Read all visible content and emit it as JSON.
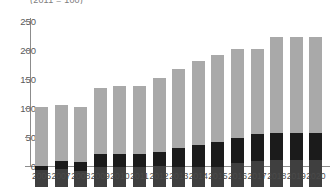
{
  "chart": {
    "subtitle_clipped": "(2011 = 100)",
    "axis": {
      "y_ticks": [
        "0",
        "50",
        "100",
        "150",
        "200",
        "250"
      ],
      "ylim": [
        0,
        270
      ]
    }
  },
  "chart_data": {
    "type": "bar",
    "stacked": true,
    "title": "",
    "subtitle": "(2011 = 100)",
    "xlabel": "",
    "ylabel": "",
    "ylim": [
      0,
      270
    ],
    "y_ticks": [
      0,
      50,
      100,
      150,
      200,
      250
    ],
    "grid": false,
    "legend": "none",
    "categories": [
      "2006",
      "2007",
      "2008",
      "2009",
      "2010",
      "2011",
      "2012",
      "2013",
      "2014",
      "2015",
      "2016",
      "2017",
      "2018",
      "2019",
      "2020"
    ],
    "series": [
      {
        "name": "bottom-segment",
        "color": "#3f3f3f",
        "values": [
          30,
          31,
          27,
          35,
          35,
          35,
          36,
          35,
          35,
          34,
          42,
          45,
          47,
          47,
          47
        ]
      },
      {
        "name": "middle-segment",
        "color": "#1b1b1b",
        "values": [
          7,
          14,
          16,
          22,
          22,
          22,
          25,
          33,
          38,
          44,
          43,
          47,
          47,
          47,
          47
        ]
      },
      {
        "name": "top-segment",
        "color": "#a9a9a9",
        "values": [
          101,
          96,
          95,
          113,
          117,
          117,
          127,
          135,
          145,
          150,
          153,
          146,
          164,
          164,
          164
        ]
      }
    ],
    "totals": [
      138,
      141,
      138,
      170,
      174,
      174,
      188,
      203,
      218,
      228,
      238,
      238,
      258,
      258,
      258
    ]
  }
}
